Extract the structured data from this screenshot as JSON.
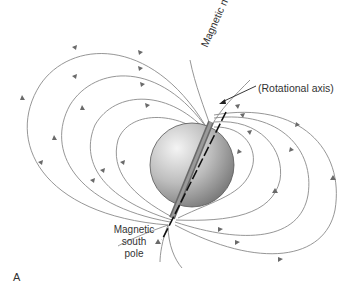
{
  "figure": {
    "panel_label": "A",
    "labels": {
      "north_pole": "Magnetic north pole",
      "rotational_axis": "(Rotational axis)",
      "south_pole_line1": "Magnetic",
      "south_pole_line2": "south",
      "south_pole_line3": "pole"
    },
    "colors": {
      "field_line": "#7a7a7a",
      "sphere_light": "#f2f2f2",
      "sphere_dark": "#8a8a8a",
      "axis": "#111111",
      "text": "#333333"
    },
    "elements": {
      "sphere": "Earth globe",
      "field_lines_left": 4,
      "field_lines_right": 4,
      "bar_magnet": "magnetic dipole inside sphere",
      "axis": "dashed rotational axis"
    }
  }
}
